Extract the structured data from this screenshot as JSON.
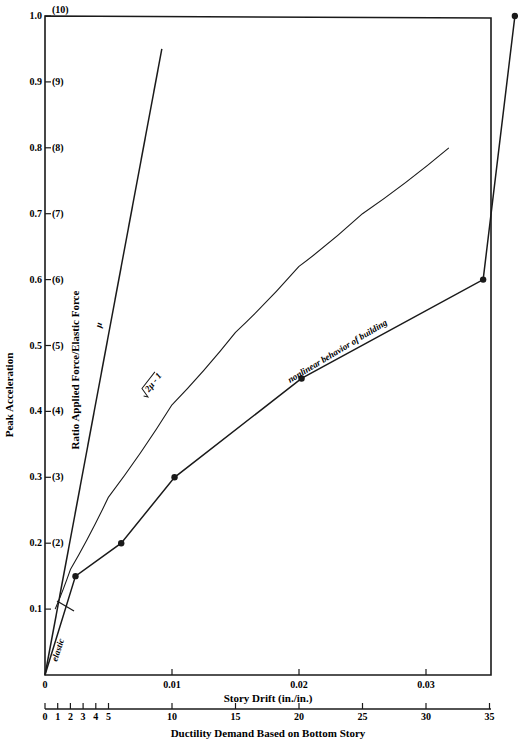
{
  "chart_data": {
    "type": "line",
    "title": "",
    "xlabel": "Story Drift (in./in.)",
    "xlabel_secondary": "Ductility Demand Based on Bottom Story",
    "ylabel": "Peak Acceleration",
    "ylabel_secondary": "Ratio Applied Force/Elastic Force",
    "xlim": [
      0,
      0.035
    ],
    "ylim": [
      0,
      1.0
    ],
    "grid": false,
    "x_ticks": [
      "0",
      "0.01",
      "0.02",
      "0.03"
    ],
    "ductility_ticks": [
      "0",
      "1",
      "2",
      "3",
      "4",
      "5",
      "10",
      "15",
      "20",
      "25",
      "30",
      "35"
    ],
    "y_ticks": [
      {
        "value": "0.1",
        "ratio": ""
      },
      {
        "value": "0.2",
        "ratio": "(2)"
      },
      {
        "value": "0.3",
        "ratio": "(3)"
      },
      {
        "value": "0.4",
        "ratio": "(4)"
      },
      {
        "value": "0.5",
        "ratio": "(5)"
      },
      {
        "value": "0.6",
        "ratio": "(6)"
      },
      {
        "value": "0.7",
        "ratio": "(7)"
      },
      {
        "value": "0.8",
        "ratio": "(8)"
      },
      {
        "value": "0.9",
        "ratio": "(9)"
      },
      {
        "value": "1.0",
        "ratio": "(10)"
      }
    ],
    "series": [
      {
        "name": "μ",
        "style": "line",
        "x": [
          0,
          0.0092
        ],
        "y": [
          0,
          0.95
        ]
      },
      {
        "name": "√(2μ-1)",
        "style": "curve",
        "x": [
          0.0008,
          0.002,
          0.005,
          0.01,
          0.015,
          0.02,
          0.025,
          0.0318
        ],
        "y": [
          0.1,
          0.16,
          0.27,
          0.41,
          0.52,
          0.62,
          0.7,
          0.8
        ]
      },
      {
        "name": "nonlinear behavior of building",
        "style": "line-with-markers",
        "x": [
          0,
          0.0024,
          0.006,
          0.0102,
          0.0202,
          0.0345,
          0.037
        ],
        "y": [
          0,
          0.15,
          0.2,
          0.3,
          0.45,
          0.6,
          1.0
        ]
      }
    ],
    "annotations": [
      "elastic",
      "μ",
      "√2μ - 1",
      "nonlinear behavior of building"
    ]
  },
  "labels": {
    "origin": "0",
    "elastic": "elastic",
    "mu": "μ",
    "sqrt": "2μ - 1",
    "nonlinear": "nonlinear behavior of building"
  }
}
